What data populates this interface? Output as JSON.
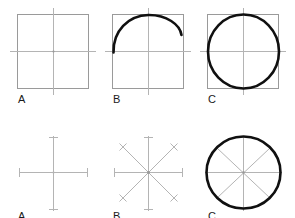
{
  "figure": {
    "canvas": {
      "width": 295,
      "height": 218,
      "background": "#ffffff"
    },
    "colors": {
      "guide_line": "#b4b4b4",
      "guide_square": "#9a9a9a",
      "heavy_stroke": "#101010",
      "label_text": "#1a1a1a"
    },
    "rows": [
      {
        "name": "square-method",
        "description": "Circle drawn inside a construction square",
        "panels": [
          {
            "label": "A",
            "name": "panel-square-blank",
            "step_description": "Draw a square with center lines",
            "elements": [
              "square",
              "horizontal-center-line",
              "vertical-center-line",
              "center-dot"
            ]
          },
          {
            "label": "B",
            "name": "panel-square-arc",
            "step_description": "Sketch arc across the upper half",
            "elements": [
              "square",
              "horizontal-center-line",
              "vertical-center-line",
              "partial-arc"
            ]
          },
          {
            "label": "C",
            "name": "panel-square-circle",
            "step_description": "Complete the circle inside the square",
            "elements": [
              "square",
              "horizontal-center-line",
              "vertical-center-line",
              "full-circle"
            ]
          }
        ]
      },
      {
        "name": "radii-method",
        "description": "Circle drawn through eight radial end marks",
        "panels": [
          {
            "label": "A",
            "name": "panel-cross-blank",
            "step_description": "Draw horizontal and vertical center lines with end ticks",
            "elements": [
              "horizontal-axis",
              "vertical-axis",
              "end-tick-marks",
              "center-dot"
            ]
          },
          {
            "label": "B",
            "name": "panel-star-radii",
            "step_description": "Add two diagonals and mark eight radius points",
            "elements": [
              "horizontal-axis",
              "vertical-axis",
              "diagonal-axis-1",
              "diagonal-axis-2",
              "end-tick-marks",
              "end-cross-marks"
            ]
          },
          {
            "label": "C",
            "name": "panel-radii-circle",
            "step_description": "Join the eight marks to form the circle",
            "elements": [
              "horizontal-axis",
              "vertical-axis",
              "diagonal-axis-1",
              "diagonal-axis-2",
              "full-circle"
            ]
          }
        ]
      }
    ],
    "labels": {
      "row1_a": "A",
      "row1_b": "B",
      "row1_c": "C",
      "row2_a": "A",
      "row2_b": "B",
      "row2_c": "C"
    }
  }
}
